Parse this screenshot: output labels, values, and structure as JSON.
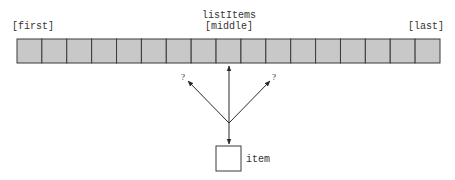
{
  "diagram": {
    "array_label": "listItems",
    "first_label": "[first]",
    "middle_label": "[middle]",
    "last_label": "[last]",
    "cell_count": 17,
    "middle_index": 8,
    "item_label": "item",
    "left_question": "?",
    "right_question": "?",
    "colors": {
      "cell_fill": "#c8c8c8",
      "cell_stroke": "#3a3a3a",
      "line": "#2a2a2a",
      "text": "#333333",
      "background": "#ffffff"
    }
  }
}
